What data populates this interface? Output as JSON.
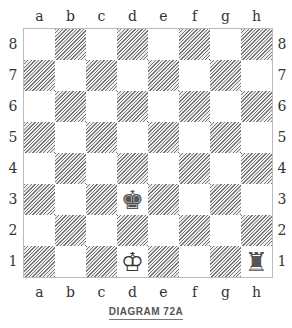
{
  "files": [
    "a",
    "b",
    "c",
    "d",
    "e",
    "f",
    "g",
    "h"
  ],
  "ranks": [
    "8",
    "7",
    "6",
    "5",
    "4",
    "3",
    "2",
    "1"
  ],
  "pieces": [
    {
      "square": "d3",
      "piece": "black-king",
      "glyph": "♚",
      "color": "#555555"
    },
    {
      "square": "d1",
      "piece": "white-king",
      "glyph": "♔",
      "color": "#333333"
    },
    {
      "square": "h1",
      "piece": "black-rook",
      "glyph": "♜",
      "color": "#555555"
    }
  ],
  "caption": "DIAGRAM 72A"
}
